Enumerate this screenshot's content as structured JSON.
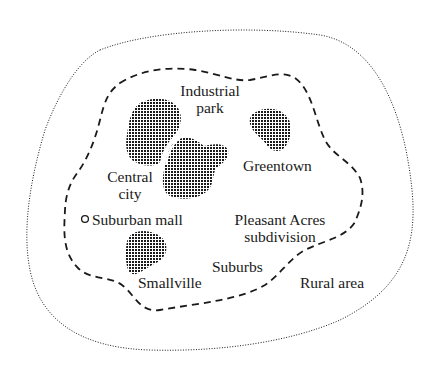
{
  "diagram": {
    "type": "land-use-map",
    "regions": {
      "rural": {
        "label": "Rural area",
        "boundary_style": "dotted"
      },
      "suburbs": {
        "label": "Suburbs",
        "boundary_style": "dashed"
      }
    },
    "places": [
      {
        "id": "industrial-park",
        "label_line1": "Industrial",
        "label_line2": "park",
        "fill": "stippled"
      },
      {
        "id": "central-city",
        "label_line1": "Central",
        "label_line2": "city",
        "fill": "stippled"
      },
      {
        "id": "greentown",
        "label_line1": "Greentown",
        "fill": "stippled"
      },
      {
        "id": "smallville",
        "label_line1": "Smallville",
        "fill": "stippled"
      },
      {
        "id": "suburban-mall",
        "label_line1": "Suburban mall",
        "marker": "open-circle"
      },
      {
        "id": "pleasant-acres",
        "label_line1": "Pleasant Acres",
        "label_line2": "subdivision"
      }
    ],
    "colors": {
      "ink": "#1a1a1a",
      "background": "#ffffff"
    }
  }
}
